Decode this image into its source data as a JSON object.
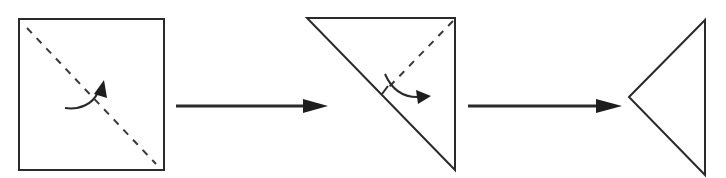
{
  "diagram": {
    "title": "",
    "kind": "origami-fold-sequence",
    "colors": {
      "line": "#2a2a2a",
      "fill": "#1e1e1e",
      "background": "#ffffff"
    },
    "steps": [
      {
        "id": "step-1",
        "shape": "square",
        "fold_line": "diagonal-top-left-to-bottom-right",
        "fold_line_style": "dashed",
        "fold_direction": "curved-arrow-up-right"
      },
      {
        "id": "step-2",
        "shape": "right-triangle",
        "fold_line": "from-top-right-corner-to-hypotenuse-midpoint",
        "fold_line_style": "dashed",
        "fold_direction": "curved-arrow-down-right"
      },
      {
        "id": "step-3",
        "shape": "triangle-pointing-left",
        "fold_line": "none",
        "fold_direction": "none"
      }
    ],
    "transitions": [
      {
        "from": "step-1",
        "to": "step-2",
        "icon": "arrow-right-icon"
      },
      {
        "from": "step-2",
        "to": "step-3",
        "icon": "arrow-right-icon"
      }
    ]
  }
}
